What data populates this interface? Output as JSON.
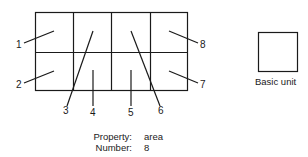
{
  "diagram": {
    "grid": {
      "rows": 2,
      "cols": 4
    },
    "callouts": [
      {
        "label": "1"
      },
      {
        "label": "2"
      },
      {
        "label": "3"
      },
      {
        "label": "4"
      },
      {
        "label": "5"
      },
      {
        "label": "6"
      },
      {
        "label": "7"
      },
      {
        "label": "8"
      }
    ],
    "basic_unit": {
      "label": "Basic unit"
    },
    "properties": [
      {
        "key": "Property:",
        "value": "area"
      },
      {
        "key": "Number:",
        "value": "8"
      }
    ]
  }
}
